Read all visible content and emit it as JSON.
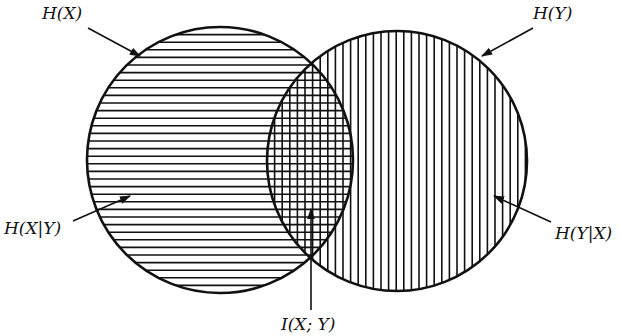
{
  "diagram": {
    "type": "venn",
    "title": "",
    "colors": {
      "stroke": "#111111",
      "background": "#ffffff"
    },
    "circles": [
      {
        "id": "X",
        "cx": 220,
        "cy": 160,
        "r": 133,
        "hatch": "horizontal",
        "hatch_spacing": 7.6
      },
      {
        "id": "Y",
        "cx": 397,
        "cy": 161,
        "r": 130,
        "hatch": "vertical",
        "hatch_spacing": 7.6
      }
    ],
    "labels": {
      "hx": "H(X)",
      "hy": "H(Y)",
      "hx_given_y": "H(X|Y)",
      "hy_given_x": "H(Y|X)",
      "mutual_info": "I(X; Y)"
    },
    "regions": [
      {
        "name": "H(X|Y)",
        "pattern": "horizontal lines",
        "description": "X only"
      },
      {
        "name": "I(X; Y)",
        "pattern": "cross-hatch",
        "description": "intersection"
      },
      {
        "name": "H(Y|X)",
        "pattern": "vertical lines",
        "description": "Y only"
      }
    ]
  }
}
